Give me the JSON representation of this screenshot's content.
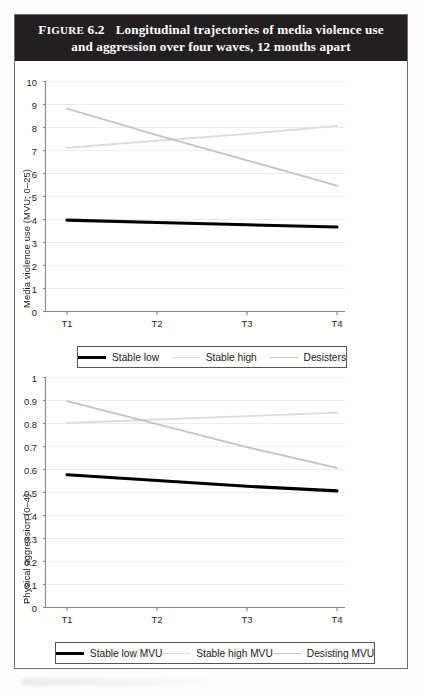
{
  "figure": {
    "label_word": "Figure",
    "number": "6.2",
    "title_line1": "Longitudinal trajectories of media violence use",
    "title_line2": "and aggression over four waves, 12 months apart",
    "title_full": "Figure 6.2  Longitudinal trajectories of media violence use and aggression over four waves, 12 months apart",
    "band_color": "#231f20",
    "band_text_color": "#ffffff"
  },
  "colors": {
    "stable_low": "#000000",
    "stable_high": "#dcdcdc",
    "desisters": "#c4c4c4",
    "grid": "#ededed",
    "axis": "#8a8a8a",
    "frame": "#6e6e6e"
  },
  "chart_data": [
    {
      "type": "line",
      "title": "Media violence use over four waves",
      "xlabel": "",
      "ylabel": "Media violence use (MVU; 0–25)",
      "x": [
        "T1",
        "T2",
        "T3",
        "T4"
      ],
      "xticklabels": [
        "T1",
        "T2",
        "T3",
        "T4"
      ],
      "yticklabels": [
        "0",
        "1",
        "2",
        "3",
        "4",
        "5",
        "6",
        "7",
        "8",
        "9",
        "10"
      ],
      "ylim": [
        0,
        10
      ],
      "ytick_step": 1,
      "grid": true,
      "legend_position": "below",
      "series": [
        {
          "name": "Stable low",
          "color": "#000000",
          "width": 3.1,
          "values": [
            3.95,
            3.85,
            3.75,
            3.65
          ]
        },
        {
          "name": "Stable high",
          "color": "#dcdcdc",
          "width": 1.9,
          "values": [
            7.1,
            7.4,
            7.7,
            8.05
          ]
        },
        {
          "name": "Desisters",
          "color": "#c4c4c4",
          "width": 1.9,
          "values": [
            8.8,
            7.65,
            6.55,
            5.45
          ]
        }
      ]
    },
    {
      "type": "line",
      "title": "Physical aggression over four waves",
      "xlabel": "",
      "ylabel": "Physical aggression (0–4)",
      "x": [
        "T1",
        "T2",
        "T3",
        "T4"
      ],
      "xticklabels": [
        "T1",
        "T2",
        "T3",
        "T4"
      ],
      "yticklabels": [
        "0",
        "0.1",
        "0.2",
        "0.3",
        "0.4",
        "0.5",
        "0.6",
        "0.7",
        "0.8",
        "0.9",
        "1"
      ],
      "ylim": [
        0,
        1
      ],
      "ytick_step": 0.1,
      "grid": true,
      "legend_position": "below",
      "series": [
        {
          "name": "Stable low MVU",
          "color": "#000000",
          "width": 3.1,
          "values": [
            0.575,
            0.55,
            0.525,
            0.505
          ]
        },
        {
          "name": "Stable high MVU",
          "color": "#dcdcdc",
          "width": 1.9,
          "values": [
            0.8,
            0.815,
            0.83,
            0.845
          ]
        },
        {
          "name": "Desisting MVU",
          "color": "#c4c4c4",
          "width": 1.9,
          "values": [
            0.895,
            0.795,
            0.695,
            0.605
          ]
        }
      ]
    }
  ],
  "legends": [
    {
      "items": [
        {
          "label": "Stable low",
          "style": "black"
        },
        {
          "label": "Stable high",
          "style": "lightest"
        },
        {
          "label": "Desisters",
          "style": "mid"
        }
      ]
    },
    {
      "items": [
        {
          "label": "Stable low MVU",
          "style": "black"
        },
        {
          "label": "Stable high MVU",
          "style": "lightest"
        },
        {
          "label": "Desisting MVU",
          "style": "mid"
        }
      ]
    }
  ]
}
